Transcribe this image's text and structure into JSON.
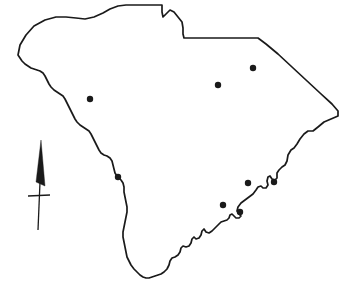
{
  "figure": {
    "name": "south-carolina-point-map",
    "width": 346,
    "height": 289,
    "background_color": "#ffffff"
  },
  "map": {
    "region_name": "South Carolina",
    "outline_color": "#1a1a1a",
    "outline_width": 1.7,
    "fill_color": "none",
    "outline_path": "M 18,55 L 20,45 L 26,35 L 34,26 L 45,20 L 56,17 L 66,17 L 76,18 L 85,19 L 94,17 L 103,13 L 110,9 L 118,6 L 126,5 L 138,5 L 150,5 L 160,5 L 162,5 L 162,12 L 163,17 L 166,14 L 170,10 L 174,12 L 178,17 L 182,22 L 183,28 L 183,34 L 184,38 L 196,38 L 210,38 L 230,38 L 248,38 L 258,38 L 266,44 L 278,54 L 292,67 L 306,80 L 320,93 L 332,104 L 338,111 L 338,116 L 331,119 L 324,122 L 318,127 L 313,131 L 308,131 L 304,134 L 300,139 L 297,144 L 294,148 L 291,150 L 288,155 L 287,161 L 285,165 L 282,167 L 279,170 L 277,173 L 277,178 L 275,180 L 272,179 L 270,176 L 268,177 L 267,181 L 268,185 L 266,188 L 263,188 L 261,186 L 258,187 L 256,190 L 253,194 L 249,197 L 245,200 L 241,203 L 238,207 L 237,211 L 239,214 L 241,216 L 239,218 L 236,218 L 234,216 L 232,214 L 230,215 L 229,218 L 227,220 L 224,221 L 221,222 L 218,225 L 215,228 L 212,231 L 209,233 L 206,232 L 204,229 L 202,231 L 201,235 L 199,238 L 196,239 L 194,237 L 192,239 L 191,243 L 189,246 L 186,247 L 183,246 L 181,248 L 180,252 L 178,255 L 175,257 L 172,258 L 170,261 L 169,265 L 167,269 L 164,272 L 161,274 L 158,275 L 155,276 L 152,277 L 149,278 L 146,278 L 143,277 L 140,275 L 137,272 L 134,269 L 131,265 L 129,261 L 127,257 L 126,252 L 125,247 L 124,242 L 123,237 L 123,232 L 124,227 L 125,222 L 126,217 L 127,212 L 127,207 L 126,202 L 125,197 L 124,192 L 124,187 L 123,183 L 121,180 L 119,178 L 117,176 L 115,173 L 114,169 L 113,165 L 112,161 L 110,158 L 107,156 L 104,155 L 101,153 L 99,150 L 97,146 L 95,142 L 93,138 L 91,134 L 89,131 L 86,129 L 83,127 L 80,125 L 77,122 L 75,119 L 73,115 L 71,111 L 69,107 L 67,103 L 65,99 L 63,96 L 60,94 L 57,92 L 54,90 L 51,87 L 49,84 L 47,80 L 45,76 L 43,73 L 40,71 L 37,70 L 34,69 L 31,68 L 28,66 L 25,64 L 22,61 L 20,58 Z"
  },
  "points": {
    "marker_color": "#1a1a1a",
    "marker_radius": 3.2,
    "count": 8,
    "items": [
      {
        "label": "site-1",
        "x": 90,
        "y": 99
      },
      {
        "label": "site-2",
        "x": 218,
        "y": 85
      },
      {
        "label": "site-3",
        "x": 253,
        "y": 68
      },
      {
        "label": "site-4",
        "x": 118,
        "y": 177
      },
      {
        "label": "site-5",
        "x": 248,
        "y": 183
      },
      {
        "label": "site-6",
        "x": 274,
        "y": 182
      },
      {
        "label": "site-7",
        "x": 223,
        "y": 205
      },
      {
        "label": "site-8",
        "x": 240,
        "y": 212
      }
    ]
  },
  "north_arrow": {
    "color": "#1a1a1a",
    "tip_x": 41,
    "tip_y": 140,
    "base_y": 186,
    "shaft_bottom_y": 230,
    "crossbar_y": 196,
    "crossbar_left_x": 28,
    "crossbar_right_x": 50,
    "head_path": "M 41,140 L 45,186 L 36,182 Z"
  }
}
